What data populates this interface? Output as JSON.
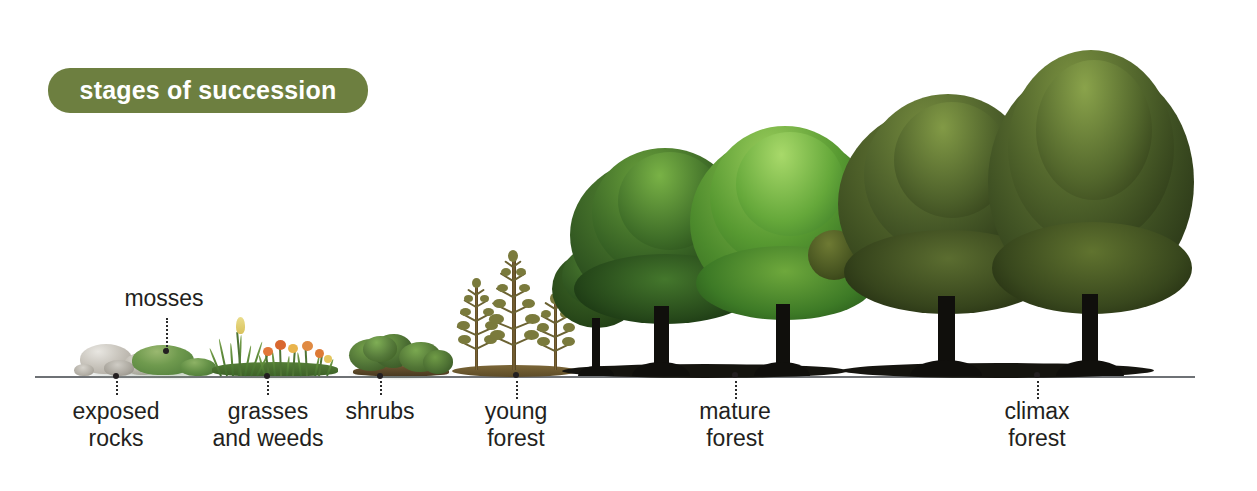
{
  "title_badge": {
    "label": "stages of succession",
    "background_color": "#6d7f40",
    "text_color": "#ffffff"
  },
  "canvas": {
    "width": 1257,
    "height": 491,
    "background_color": "#ffffff"
  },
  "ground_line": {
    "color": "#6e7175",
    "y": 376,
    "x_start": 35,
    "x_end": 1195
  },
  "stages": [
    {
      "id": "exposed-rocks",
      "label": "exposed\nrocks",
      "label_position": "below",
      "order": 1,
      "icon": "rocks-icon"
    },
    {
      "id": "mosses",
      "label": "mosses",
      "label_position": "above",
      "order": 2,
      "icon": "moss-icon"
    },
    {
      "id": "grasses-and-weeds",
      "label": "grasses\nand weeds",
      "label_position": "below",
      "order": 3,
      "icon": "grass-icon"
    },
    {
      "id": "shrubs",
      "label": "shrubs",
      "label_position": "below",
      "order": 4,
      "icon": "shrub-icon"
    },
    {
      "id": "young-forest",
      "label": "young\nforest",
      "label_position": "below",
      "order": 5,
      "icon": "sapling-icon"
    },
    {
      "id": "mature-forest",
      "label": "mature\nforest",
      "label_position": "below",
      "order": 6,
      "icon": "tree-icon"
    },
    {
      "id": "climax-forest",
      "label": "climax\nforest",
      "label_position": "below",
      "order": 7,
      "icon": "tree-icon"
    }
  ],
  "palette": {
    "badge_green": "#6d7f40",
    "rock_gray": "#c9c5bd",
    "moss_green": "#6f9a4e",
    "grass_green": "#5d8a3a",
    "flower_orange": "#e08a42",
    "flower_yellow": "#e3d16a",
    "shrub_green": "#4f7236",
    "sapling_olive": "#7a7a3c",
    "sapling_trunk": "#7a6334",
    "mature_light_green": "#7cb342",
    "mature_dark_green": "#2f5420",
    "climax_green": "#4a5a28",
    "trunk_black": "#100f0c",
    "label_black": "#231f20",
    "ground_gray": "#6e7175"
  }
}
